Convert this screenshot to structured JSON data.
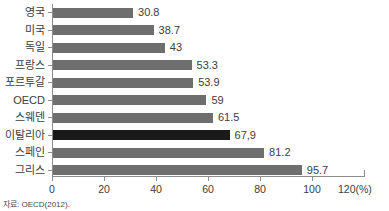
{
  "chart_data": {
    "type": "bar",
    "orientation": "horizontal",
    "title": "",
    "xlabel": "(%)",
    "ylabel": "",
    "xlim": [
      0,
      120
    ],
    "grid": false,
    "legend": null,
    "categories": [
      "영국",
      "미국",
      "독일",
      "프랑스",
      "포르투갈",
      "OECD",
      "스웨덴",
      "이탈리아",
      "스페인",
      "그리스"
    ],
    "values": [
      30.8,
      38.7,
      43,
      53.3,
      53.9,
      59,
      61.5,
      67.9,
      81.2,
      95.7
    ],
    "value_labels": [
      "30.8",
      "38.7",
      "43",
      "53.3",
      "53.9",
      "59",
      "61.5",
      "67,9",
      "81.2",
      "95.7"
    ],
    "highlight_index": 7,
    "xticks": [
      0,
      20,
      40,
      60,
      80,
      100,
      120
    ],
    "xtick_labels": [
      "0",
      "20",
      "40",
      "60",
      "80",
      "100",
      "120(%)"
    ],
    "colors": {
      "bar": "#6e6e6e",
      "bar_highlight": "#1a1a1a",
      "axis": "#8c8c8c",
      "text": "#3c3c3c",
      "background": "#ffffff"
    },
    "source_note": "자료: OECD(2012)."
  }
}
